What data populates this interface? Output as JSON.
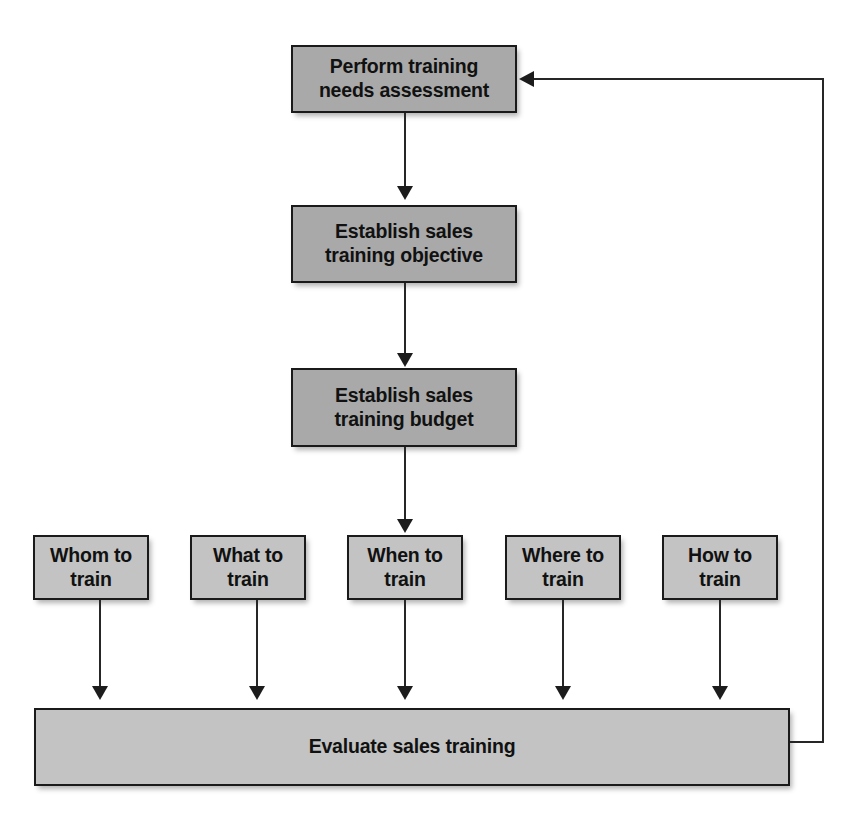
{
  "diagram": {
    "type": "flowchart",
    "colors": {
      "node_fill_dark": "#a9a9a9",
      "node_fill_light": "#c3c3c3",
      "node_border": "#1a1a1a",
      "connector": "#262626",
      "text": "#111111",
      "background": "#ffffff"
    },
    "scan_artifact_text": "",
    "stages": [
      {
        "id": "needs-assessment",
        "label": "Perform training\nneeds assessment"
      },
      {
        "id": "training-objective",
        "label": "Establish sales\ntraining objective"
      },
      {
        "id": "training-budget",
        "label": "Establish sales\ntraining budget"
      }
    ],
    "question_nodes": [
      {
        "id": "whom-to-train",
        "label": "Whom to\ntrain"
      },
      {
        "id": "what-to-train",
        "label": "What to\ntrain"
      },
      {
        "id": "when-to-train",
        "label": "When to\ntrain"
      },
      {
        "id": "where-to-train",
        "label": "Where to\ntrain"
      },
      {
        "id": "how-to-train",
        "label": "How to\ntrain"
      }
    ],
    "evaluate": {
      "id": "evaluate-sales-training",
      "label": "Evaluate sales training"
    },
    "connectors": [
      {
        "from": "needs-assessment",
        "to": "training-objective",
        "kind": "arrow-down"
      },
      {
        "from": "training-objective",
        "to": "training-budget",
        "kind": "arrow-down"
      },
      {
        "from": "training-budget",
        "to": "when-to-train",
        "kind": "arrow-down"
      },
      {
        "from": "whom-to-train",
        "to": "evaluate-sales-training",
        "kind": "arrow-down"
      },
      {
        "from": "what-to-train",
        "to": "evaluate-sales-training",
        "kind": "arrow-down"
      },
      {
        "from": "when-to-train",
        "to": "evaluate-sales-training",
        "kind": "arrow-down"
      },
      {
        "from": "where-to-train",
        "to": "evaluate-sales-training",
        "kind": "arrow-down"
      },
      {
        "from": "how-to-train",
        "to": "evaluate-sales-training",
        "kind": "arrow-down"
      },
      {
        "from": "evaluate-sales-training",
        "to": "needs-assessment",
        "kind": "feedback-loop"
      }
    ]
  }
}
